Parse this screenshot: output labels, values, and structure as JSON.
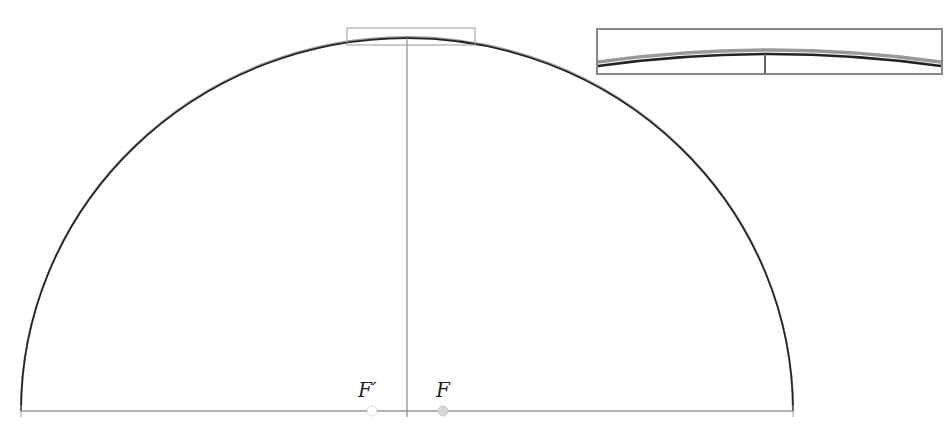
{
  "diagram": {
    "type": "half-ellipse with foci",
    "labels": {
      "focus_left": "F′",
      "focus_right": "F"
    },
    "colors": {
      "curve": "#222222",
      "axis": "#888888",
      "inset_border": "#888888",
      "focus_left_fill": "#ffffff",
      "focus_right_fill": "#d8d8d8"
    },
    "inset": {
      "description": "magnified view of apex region"
    }
  }
}
